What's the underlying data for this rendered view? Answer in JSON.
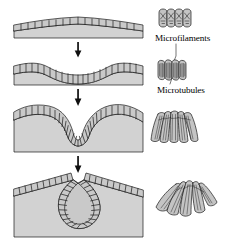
{
  "figure": {
    "kind": "biology-diagram",
    "background_color": "#ffffff",
    "line_color": "#1a1a1a",
    "tissue_fill": "#d2d2d2",
    "cell_fill": "#c8c8c8",
    "cell_fill_light": "#dcdcdc",
    "lumen_fill": "#ffffff",
    "width": 236,
    "height": 246
  },
  "labels": {
    "microfilaments": "Microfilaments",
    "microtubules": "Microtubules"
  },
  "stages": [
    {
      "index": 1,
      "name": "flat-epithelium",
      "description": "Flat epithelial sheet of cuboidal cells on a gray tissue slab, gently domed."
    },
    {
      "index": 2,
      "name": "shallow-placode",
      "description": "Cells elongate into columnar shapes and the sheet forms a broad shallow depression."
    },
    {
      "index": 3,
      "name": "deep-groove",
      "description": "Apical constriction wedges the cells, producing a deep narrow U-shaped groove."
    },
    {
      "index": 4,
      "name": "closing-vesicle",
      "description": "Groove lips meet and pinch off, enclosing a flask-shaped lumen beneath the surface."
    }
  ],
  "cell_details": [
    {
      "index": 1,
      "name": "cuboidal-cells-microfilaments",
      "cell_count": 4,
      "shape": "cuboidal",
      "internal_structure": "microfilaments",
      "marking": "crossed X-shaped filament bundles inside each cell"
    },
    {
      "index": 2,
      "name": "columnar-cells-microtubules",
      "cell_count": 4,
      "shape": "columnar",
      "internal_structure": "microtubules",
      "marking": "vertical parallel striations spanning cell height"
    },
    {
      "index": 3,
      "name": "wedge-cells",
      "cell_count": 5,
      "shape": "wedge",
      "internal_structure": "microtubules and apical microfilament ring",
      "marking": "tapering striations converging toward narrow apex"
    },
    {
      "index": 4,
      "name": "constricted-wedge-cells",
      "cell_count": 5,
      "shape": "strongly-wedged",
      "internal_structure": "constricted apical microfilament ring",
      "marking": "radial striations converging to a point"
    }
  ],
  "arrows": [
    {
      "index": 1,
      "name": "stage-1-to-2-arrow",
      "direction": "down"
    },
    {
      "index": 2,
      "name": "stage-2-to-3-arrow",
      "direction": "down"
    },
    {
      "index": 3,
      "name": "stage-3-to-4-arrow",
      "direction": "down"
    }
  ],
  "leader_lines": [
    {
      "name": "microfilaments-leader",
      "from": "microfilaments-label",
      "to": "columnar-cells-microtubules"
    },
    {
      "name": "microtubules-leader",
      "from": "microtubules-label",
      "to": "columnar-cells-microtubules"
    }
  ]
}
